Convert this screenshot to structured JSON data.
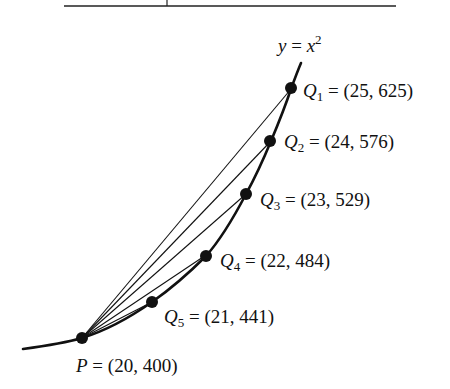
{
  "diagram": {
    "curve_label": {
      "lhs": "y",
      "eq": " = ",
      "base": "x",
      "exp": "2"
    },
    "point_P": {
      "name": "P",
      "coords": " = (20, 400)"
    },
    "points_Q": [
      {
        "name": "Q",
        "sub": "1",
        "coords": " = (25, 625)"
      },
      {
        "name": "Q",
        "sub": "2",
        "coords": " = (24, 576)"
      },
      {
        "name": "Q",
        "sub": "3",
        "coords": " = (23, 529)"
      },
      {
        "name": "Q",
        "sub": "4",
        "coords": " = (22, 484)"
      },
      {
        "name": "Q",
        "sub": "5",
        "coords": " = (21, 441)"
      }
    ],
    "colors": {
      "ink": "#111111",
      "background": "#ffffff"
    }
  }
}
